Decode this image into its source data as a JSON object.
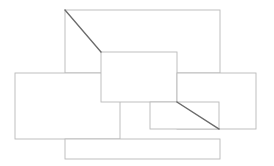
{
  "canvas": {
    "width": 274,
    "height": 166,
    "background_color": "#ffffff",
    "title": ""
  },
  "style": {
    "outline_color": "#b9b9b9",
    "outline_width": 0.9,
    "diagonal_color": "#6b6b6b",
    "diagonal_width": 1.3,
    "fill_color": "#ffffff"
  },
  "chart_data": {
    "type": "diagram",
    "title": "",
    "shapes": [
      {
        "name": "top-rectangle",
        "kind": "rectangle",
        "x": 65,
        "y": 10,
        "width": 155,
        "height": 63
      },
      {
        "name": "left-rectangle",
        "kind": "rectangle",
        "x": 15,
        "y": 73,
        "width": 105,
        "height": 66
      },
      {
        "name": "center-rectangle",
        "kind": "rectangle",
        "x": 101,
        "y": 52,
        "width": 76,
        "height": 50
      },
      {
        "name": "right-rectangle",
        "kind": "rectangle",
        "x": 177,
        "y": 73,
        "width": 79,
        "height": 56
      },
      {
        "name": "bottom-middle-rectangle",
        "kind": "rectangle",
        "x": 150,
        "y": 102,
        "width": 69,
        "height": 27
      },
      {
        "name": "bottom-rectangle",
        "kind": "rectangle",
        "x": 65,
        "y": 139,
        "width": 155,
        "height": 20
      }
    ],
    "diagonals": [
      {
        "name": "upper-left-diagonal",
        "x1": 65,
        "y1": 10,
        "x2": 101,
        "y2": 52
      },
      {
        "name": "lower-right-diagonal",
        "x1": 177,
        "y1": 102,
        "x2": 219,
        "y2": 129
      }
    ]
  }
}
